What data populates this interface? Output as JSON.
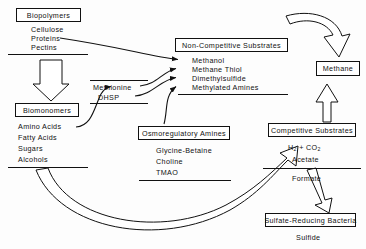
{
  "diagram": {
    "type": "flow-diagram",
    "stroke_color": "#111111",
    "background_color": "#fdfdfd"
  },
  "nodes": {
    "biopolymers": {
      "label": "Biopolymers"
    },
    "biomonomers": {
      "label": "Biomonomers"
    },
    "non_competitive": {
      "label": "Non-Competitive Substrates"
    },
    "osmoregulatory": {
      "label": "Osmoregulatory Amines"
    },
    "competitive": {
      "label": "Competitive Substrates"
    },
    "methane": {
      "label": "Methane"
    },
    "srb": {
      "label": "Sulfate-Reducing Bacteria"
    }
  },
  "lists": {
    "biopolymers_items": [
      "Cellulose",
      "Proteins",
      "Pectins"
    ],
    "biomonomers_items": [
      "Amino Acids",
      "Fatty Acids",
      "Sugars",
      "Alcohols"
    ],
    "methyl_donors": [
      "Methionine",
      "DHSP"
    ],
    "non_competitive_items": [
      "Methanol",
      "Methane Thiol",
      "Dimethylsulfide",
      "Methylated Amines"
    ],
    "osmoregulatory_items": [
      "Glycine-Betaine",
      "Choline",
      "TMAO"
    ],
    "competitive_items": [
      "H",
      "2",
      " + CO",
      "2",
      "Acetate"
    ],
    "competitive_line1_a": "H",
    "competitive_line1_sub1": "2",
    "competitive_line1_b": " + CO",
    "competitive_line1_sub2": "2",
    "competitive_line2": "Acetate"
  },
  "labels": {
    "formate": "Formate",
    "sulfide": "Sulfide"
  }
}
